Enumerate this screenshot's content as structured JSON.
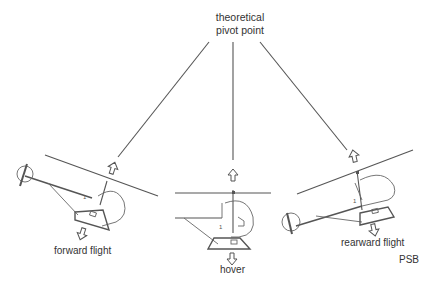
{
  "title": {
    "line1": "theoretical",
    "line2": "pivot point"
  },
  "labels": {
    "forward": "forward flight",
    "hover": "hover",
    "rearward": "rearward flight",
    "credit": "PSB"
  },
  "helicopters": [
    {
      "id": "forward",
      "attitude": "nose-down",
      "tilt_deg": 18
    },
    {
      "id": "hover",
      "attitude": "level",
      "tilt_deg": 0
    },
    {
      "id": "rearward",
      "attitude": "nose-up",
      "tilt_deg": -18
    }
  ],
  "colors": {
    "line": "#555555",
    "text": "#333333",
    "background": "#ffffff"
  }
}
